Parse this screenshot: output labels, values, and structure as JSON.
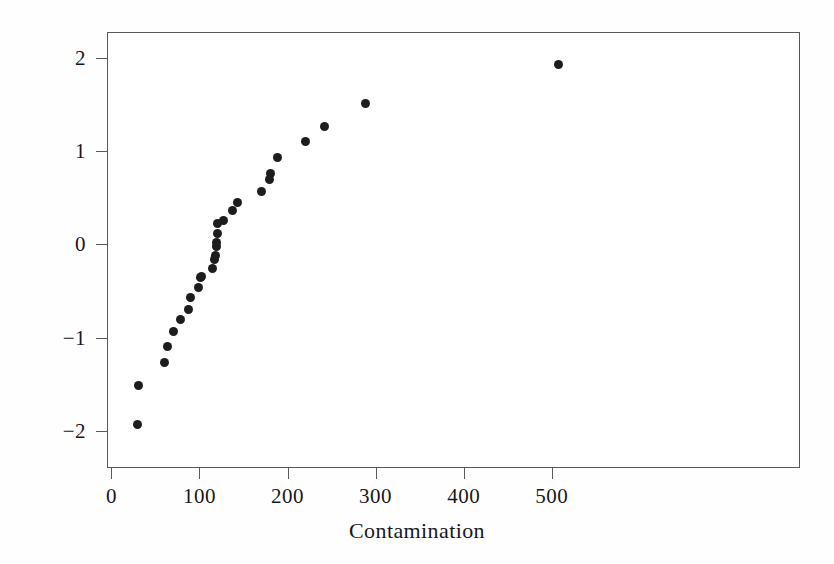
{
  "chart_data": {
    "type": "scatter",
    "title": "",
    "subtitle": "",
    "xlabel": "Contamination",
    "ylabel": "Quantiles for standard normal",
    "xlim": [
      -5,
      782
    ],
    "ylim": [
      -2.4,
      2.28
    ],
    "xticks": [
      0,
      100,
      200,
      300,
      400,
      500
    ],
    "yticks": [
      -2,
      -1,
      0,
      1,
      2
    ],
    "xtick_labels": [
      "0",
      "100",
      "200",
      "300",
      "400",
      "500"
    ],
    "ytick_labels": [
      "-2",
      "-1",
      "0",
      "1",
      "2"
    ],
    "grid": false,
    "legend": "none",
    "marker": "filled-circle",
    "marker_color": "#1d1d1f",
    "marker_size": 9,
    "frame_color": "#58585a",
    "background": "#ffffff",
    "n_points": 28,
    "series": [
      {
        "name": "Contamination normal quantiles",
        "points": [
          {
            "x": 30,
            "y": -1.93
          },
          {
            "x": 31,
            "y": -1.51
          },
          {
            "x": 60,
            "y": -1.27
          },
          {
            "x": 64,
            "y": -1.1
          },
          {
            "x": 70,
            "y": -0.93
          },
          {
            "x": 78,
            "y": -0.81
          },
          {
            "x": 87,
            "y": -0.7
          },
          {
            "x": 90,
            "y": -0.57
          },
          {
            "x": 99,
            "y": -0.46
          },
          {
            "x": 101,
            "y": -0.36
          },
          {
            "x": 102,
            "y": -0.34
          },
          {
            "x": 115,
            "y": -0.26
          },
          {
            "x": 117,
            "y": -0.16
          },
          {
            "x": 118,
            "y": -0.12
          },
          {
            "x": 119,
            "y": -0.02
          },
          {
            "x": 119,
            "y": 0.02
          },
          {
            "x": 120,
            "y": 0.12
          },
          {
            "x": 121,
            "y": 0.22
          },
          {
            "x": 127,
            "y": 0.26
          },
          {
            "x": 138,
            "y": 0.36
          },
          {
            "x": 143,
            "y": 0.45
          },
          {
            "x": 171,
            "y": 0.57
          },
          {
            "x": 180,
            "y": 0.7
          },
          {
            "x": 181,
            "y": 0.76
          },
          {
            "x": 189,
            "y": 0.93
          },
          {
            "x": 220,
            "y": 1.1
          },
          {
            "x": 242,
            "y": 1.27
          },
          {
            "x": 289,
            "y": 1.51
          },
          {
            "x": 508,
            "y": 1.93
          }
        ]
      }
    ]
  }
}
